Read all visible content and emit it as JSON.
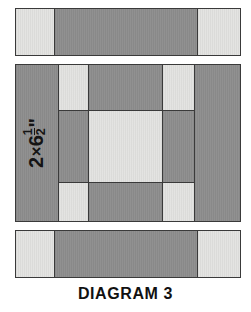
{
  "figure": {
    "caption": "DIAGRAM 3",
    "label": {
      "size": "2×6½\"",
      "width_number": "2",
      "times": "×",
      "length_whole": "6",
      "fraction_numerator": "1",
      "fraction_denominator": "2",
      "inch_mark": "\""
    }
  },
  "colors": {
    "dark_fabric": "#8e8e8e",
    "light_fabric": "#e3e3e1",
    "outline": "#3a3a3a",
    "background": "#ffffff",
    "caption_text": "#111111",
    "label_text": "#141414"
  },
  "assemblies": {
    "top_strip": {
      "name": "top sashing strip",
      "pieces": [
        {
          "fabric": "light",
          "x": 0,
          "y": 0,
          "w": 40,
          "h": 48
        },
        {
          "fabric": "dark",
          "x": 39,
          "y": 0,
          "w": 144,
          "h": 48
        },
        {
          "fabric": "light",
          "x": 182,
          "y": 0,
          "w": 44,
          "h": 48
        }
      ]
    },
    "center_block": {
      "name": "center nine patch block",
      "pieces": [
        {
          "fabric": "dark",
          "x": 0,
          "y": 0,
          "w": 44,
          "h": 158
        },
        {
          "fabric": "light",
          "x": 43,
          "y": 0,
          "w": 31,
          "h": 47
        },
        {
          "fabric": "dark",
          "x": 73,
          "y": 0,
          "w": 75,
          "h": 47
        },
        {
          "fabric": "light",
          "x": 147,
          "y": 0,
          "w": 33,
          "h": 47
        },
        {
          "fabric": "dark",
          "x": 179,
          "y": 0,
          "w": 47,
          "h": 158
        },
        {
          "fabric": "dark",
          "x": 43,
          "y": 46,
          "w": 31,
          "h": 73
        },
        {
          "fabric": "light",
          "x": 73,
          "y": 46,
          "w": 75,
          "h": 73
        },
        {
          "fabric": "dark",
          "x": 147,
          "y": 46,
          "w": 33,
          "h": 73
        },
        {
          "fabric": "light",
          "x": 43,
          "y": 118,
          "w": 31,
          "h": 40
        },
        {
          "fabric": "dark",
          "x": 73,
          "y": 118,
          "w": 75,
          "h": 40
        },
        {
          "fabric": "light",
          "x": 147,
          "y": 118,
          "w": 33,
          "h": 40
        }
      ]
    },
    "bottom_strip": {
      "name": "bottom sashing strip",
      "pieces": [
        {
          "fabric": "light",
          "x": 0,
          "y": 0,
          "w": 40,
          "h": 48
        },
        {
          "fabric": "dark",
          "x": 39,
          "y": 0,
          "w": 144,
          "h": 48
        },
        {
          "fabric": "light",
          "x": 182,
          "y": 0,
          "w": 44,
          "h": 48
        }
      ]
    }
  }
}
